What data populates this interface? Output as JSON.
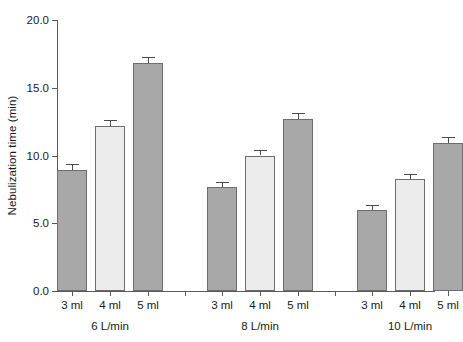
{
  "chart_data": {
    "type": "bar",
    "title": "",
    "xlabel": "",
    "ylabel": "Nebulization time (min)",
    "ylim": [
      0.0,
      20.0
    ],
    "ytick_labels": [
      "0.0",
      "5.0",
      "10.0",
      "15.0",
      "20.0"
    ],
    "ytick_values": [
      0.0,
      5.0,
      10.0,
      15.0,
      20.0
    ],
    "grid": false,
    "legend": "none",
    "groups": [
      {
        "label": "6 L/min",
        "categories": [
          "3 ml",
          "4 ml",
          "5 ml"
        ],
        "values": [
          8.9,
          12.2,
          16.8
        ],
        "errors": [
          0.45,
          0.45,
          0.5
        ],
        "shades": [
          "dark",
          "light",
          "dark"
        ]
      },
      {
        "label": "8 L/min",
        "categories": [
          "3 ml",
          "4 ml",
          "5 ml"
        ],
        "values": [
          7.7,
          10.0,
          12.7
        ],
        "errors": [
          0.35,
          0.4,
          0.45
        ],
        "shades": [
          "dark",
          "light",
          "dark"
        ]
      },
      {
        "label": "10 L/min",
        "categories": [
          "3 ml",
          "4 ml",
          "5 ml"
        ],
        "values": [
          6.0,
          8.3,
          10.9
        ],
        "errors": [
          0.35,
          0.35,
          0.45
        ],
        "shades": [
          "dark",
          "light",
          "dark"
        ]
      }
    ],
    "colors": {
      "bar_dark": "#a8a8a8",
      "bar_light": "#ececec",
      "bar_edge": "#6d6d6d",
      "axis": "#5a5a5a",
      "error_bar": "#4a4a4a",
      "background": "#ffffff",
      "text": "#1a1a1a"
    }
  }
}
